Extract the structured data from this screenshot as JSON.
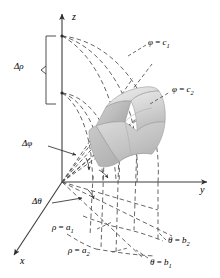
{
  "figure": {
    "kind": "spherical-coordinates-volume-element",
    "background_color": "#ffffff",
    "line_color": "#3d3d3d",
    "dash_color": "#4a4a4a",
    "solid_fill_light": "#e4e4e4",
    "solid_fill_mid": "#cfcfcf",
    "solid_fill_dark": "#b4b4b4"
  },
  "axes": {
    "z_label": "z",
    "y_label": "y",
    "x_label": "x"
  },
  "labels": {
    "delta_rho": "Δρ",
    "delta_phi": "Δφ",
    "delta_theta": "Δθ",
    "phi_c1_var": "φ",
    "phi_c1_op": " = ",
    "phi_c1_val": "c",
    "phi_c1_sub": "1",
    "phi_c2_var": "φ",
    "phi_c2_op": " = ",
    "phi_c2_val": "c",
    "phi_c2_sub": "2",
    "rho_a1_var": "ρ",
    "rho_a1_op": " = ",
    "rho_a1_val": "a",
    "rho_a1_sub": "1",
    "rho_a2_var": "ρ",
    "rho_a2_op": " = ",
    "rho_a2_val": "a",
    "rho_a2_sub": "2",
    "theta_b1_var": "θ",
    "theta_b1_op": " = ",
    "theta_b1_val": "b",
    "theta_b1_sub": "1",
    "theta_b2_var": "θ",
    "theta_b2_op": " = ",
    "theta_b2_val": "b",
    "theta_b2_sub": "2"
  }
}
